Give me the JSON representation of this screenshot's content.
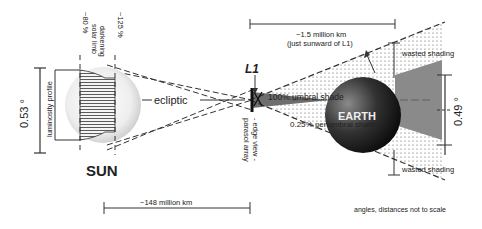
{
  "labels": {
    "sun": "SUN",
    "earth": "EARTH",
    "l1": "L1",
    "ecliptic": "ecliptic",
    "sun_angle": "0.53 °",
    "earth_angle": "0.49 °",
    "luminosity_profile": "luminosity profile",
    "limb_darkening_line1": "solar limb",
    "limb_darkening_line2": "darkening",
    "pct_80": "~80 %",
    "pct_125": "~125 %",
    "parasol_line1": "parasol array",
    "parasol_line2": "- edge view -",
    "umbral": "100%  umbral  shade",
    "penumbral": "0.25% penumbral shade",
    "wasted_top": "wasted shading",
    "wasted_bottom": "wasted shading",
    "dist_l1_line1": "~1.5 million km",
    "dist_l1_line2": "(just sunward of L1)",
    "dist_sun": "~148 million km",
    "note": "angles, distances not to scale"
  },
  "colors": {
    "line": "#333333",
    "umbra": "#6e6e6e",
    "earth_dark": "#1a1a1a",
    "earth_light": "#7a7a7a",
    "sun_light": "#f8f8f8",
    "sun_edge": "#cfcfcf"
  }
}
